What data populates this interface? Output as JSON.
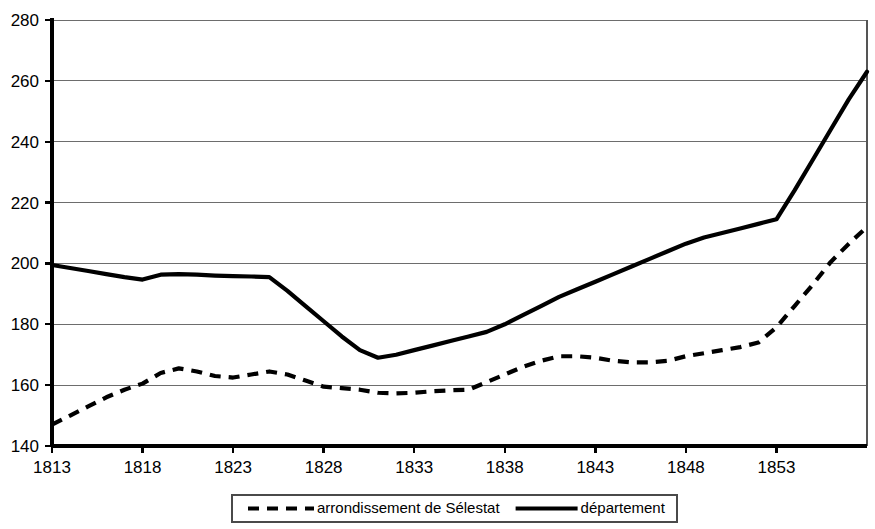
{
  "chart_data": {
    "type": "line",
    "title": "",
    "subtitle": "",
    "xlabel": "",
    "ylabel": "",
    "xlim": [
      1813,
      1858
    ],
    "ylim": [
      140,
      280
    ],
    "grid": true,
    "grid_axis": "y",
    "legend_position": "bottom",
    "y_ticks": [
      140,
      160,
      180,
      200,
      220,
      240,
      260,
      280
    ],
    "y_tick_labels": [
      "140",
      "160",
      "180",
      "200",
      "220",
      "240",
      "260",
      "280"
    ],
    "x_ticks": [
      1813,
      1818,
      1823,
      1828,
      1833,
      1838,
      1843,
      1848,
      1853
    ],
    "x_tick_labels": [
      "1813",
      "1818",
      "1823",
      "1828",
      "1833",
      "1838",
      "1843",
      "1848",
      "1853"
    ],
    "series": [
      {
        "name": "arrondissement de Sélestat",
        "style": "dashed",
        "color": "#000000",
        "x": [
          1813,
          1814,
          1815,
          1816,
          1817,
          1818,
          1819,
          1820,
          1821,
          1822,
          1823,
          1824,
          1825,
          1826,
          1827,
          1828,
          1829,
          1830,
          1831,
          1832,
          1833,
          1834,
          1835,
          1836,
          1837,
          1838,
          1839,
          1840,
          1841,
          1842,
          1843,
          1844,
          1845,
          1846,
          1847,
          1848,
          1849,
          1850,
          1851,
          1852,
          1853,
          1854,
          1855,
          1856,
          1857,
          1858
        ],
        "values": [
          147,
          150,
          153,
          156,
          158.5,
          160.5,
          164,
          165.5,
          164.5,
          163,
          162.5,
          163.5,
          164.5,
          163.5,
          161.5,
          159.5,
          159,
          158.5,
          157.5,
          157.3,
          157.5,
          158,
          158.3,
          158.5,
          161,
          163.5,
          166,
          168,
          169.5,
          169.5,
          169,
          168,
          167.5,
          167.5,
          168,
          169.5,
          170.5,
          171.5,
          172.5,
          174,
          179,
          186,
          193,
          200.5,
          206.5,
          212
        ]
      },
      {
        "name": "département",
        "style": "solid",
        "color": "#000000",
        "x": [
          1813,
          1814,
          1815,
          1816,
          1817,
          1818,
          1819,
          1820,
          1821,
          1822,
          1823,
          1824,
          1825,
          1826,
          1827,
          1828,
          1829,
          1830,
          1831,
          1832,
          1833,
          1834,
          1835,
          1836,
          1837,
          1838,
          1839,
          1840,
          1841,
          1842,
          1843,
          1844,
          1845,
          1846,
          1847,
          1848,
          1849,
          1850,
          1851,
          1852,
          1853,
          1854,
          1855,
          1856,
          1857,
          1858
        ],
        "values": [
          199.5,
          198.5,
          197.5,
          196.5,
          195.5,
          194.7,
          196.3,
          196.5,
          196.3,
          196,
          195.8,
          195.7,
          195.5,
          191,
          186,
          181,
          176,
          171.5,
          169,
          170,
          171.5,
          173,
          174.5,
          176,
          177.5,
          180,
          183,
          186,
          189,
          191.5,
          194,
          196.5,
          199,
          201.5,
          204,
          206.5,
          208.5,
          210,
          211.5,
          213,
          214.5,
          224,
          234,
          244,
          254,
          263
        ]
      }
    ],
    "legend": [
      {
        "label": "arrondissement de Sélestat",
        "style": "dashed"
      },
      {
        "label": "département",
        "style": "solid"
      }
    ]
  }
}
